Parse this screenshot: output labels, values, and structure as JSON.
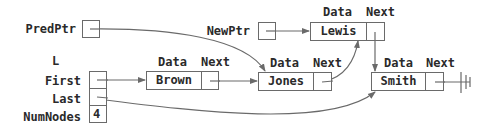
{
  "diagram": {
    "type": "linked-list-insertion",
    "pointers": {
      "pred_ptr": {
        "label": "PredPtr"
      },
      "new_ptr": {
        "label": "NewPtr"
      }
    },
    "list_header": {
      "label": "L",
      "fields": [
        {
          "label": "First",
          "value": ""
        },
        {
          "label": "Last",
          "value": ""
        },
        {
          "label": "NumNodes",
          "value": "4"
        }
      ]
    },
    "node_field_labels": {
      "data": "Data",
      "next": "Next"
    },
    "nodes": [
      {
        "id": "brown",
        "data": "Brown"
      },
      {
        "id": "jones",
        "data": "Jones"
      },
      {
        "id": "lewis",
        "data": "Lewis"
      },
      {
        "id": "smith",
        "data": "Smith"
      }
    ],
    "edges": [
      {
        "from": "PredPtr",
        "to": "Jones"
      },
      {
        "from": "NewPtr",
        "to": "Lewis"
      },
      {
        "from": "First",
        "to": "Brown"
      },
      {
        "from": "Brown.Next",
        "to": "Jones"
      },
      {
        "from": "Jones.Next",
        "to": "Lewis"
      },
      {
        "from": "Lewis.Next",
        "to": "Smith"
      },
      {
        "from": "Last",
        "to": "Smith"
      },
      {
        "from": "Smith.Next",
        "to": "null"
      }
    ],
    "colors": {
      "line": "#6a6a6a",
      "text": "#2a2a2a",
      "background": "#ffffff"
    }
  }
}
